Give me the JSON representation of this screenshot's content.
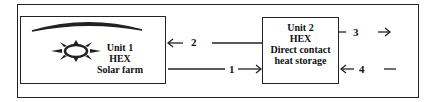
{
  "diagram": {
    "unit1": {
      "lines": [
        "Unit 1",
        "HEX",
        "Solar farm"
      ],
      "icons": [
        "solar-collector-icon",
        "sun-icon"
      ]
    },
    "unit2": {
      "lines": [
        "Unit 2",
        "HEX",
        "Direct contact",
        "heat storage"
      ]
    },
    "streams": [
      {
        "id": "1",
        "label": "1",
        "from": "unit1",
        "to": "unit2"
      },
      {
        "id": "2",
        "label": "2",
        "from": "unit2",
        "to": "unit1"
      },
      {
        "id": "3",
        "label": "3",
        "from": "unit2",
        "to": "out"
      },
      {
        "id": "4",
        "label": "4",
        "from": "in",
        "to": "unit2"
      }
    ],
    "colors": {
      "stroke": "#222222",
      "background": "#ffffff"
    }
  }
}
